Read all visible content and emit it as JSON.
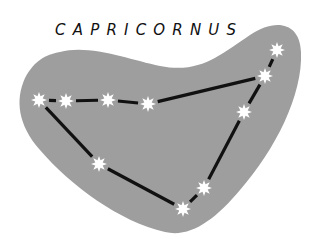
{
  "title": "CAPRICORNUS",
  "colors": {
    "background": "#ffffff",
    "region": "#9e9e9e",
    "line": "#111111",
    "star": "#ffffff"
  },
  "stars": [
    {
      "x": 39,
      "y": 100
    },
    {
      "x": 66,
      "y": 101
    },
    {
      "x": 108,
      "y": 100
    },
    {
      "x": 148,
      "y": 104
    },
    {
      "x": 265,
      "y": 76
    },
    {
      "x": 277,
      "y": 50
    },
    {
      "x": 244,
      "y": 112
    },
    {
      "x": 204,
      "y": 188
    },
    {
      "x": 183,
      "y": 209
    },
    {
      "x": 99,
      "y": 164
    }
  ],
  "lines": [
    [
      0,
      1
    ],
    [
      1,
      2
    ],
    [
      2,
      3
    ],
    [
      3,
      4
    ],
    [
      4,
      5
    ],
    [
      4,
      6
    ],
    [
      6,
      7
    ],
    [
      7,
      8
    ],
    [
      8,
      9
    ],
    [
      9,
      0
    ]
  ]
}
